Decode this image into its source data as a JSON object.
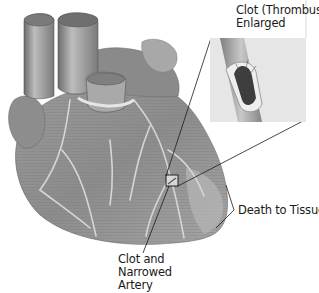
{
  "figure": {
    "labels": {
      "thrombus": {
        "line1": "Clot (Thrombus",
        "line2": "Enlarged"
      },
      "death": {
        "line1": "Death to Tissue"
      },
      "clot": {
        "line1": "Clot and",
        "line2": "Narrowed",
        "line3": "Artery"
      }
    },
    "colors": {
      "background": "#ffffff",
      "heart_base": "#8a8a8a",
      "heart_light": "#b8b8b8",
      "heart_dark": "#5a5a5a",
      "vessel": "#d9d9d9",
      "line": "#1a1a1a",
      "inset_bg": "#e4e4e4"
    }
  }
}
